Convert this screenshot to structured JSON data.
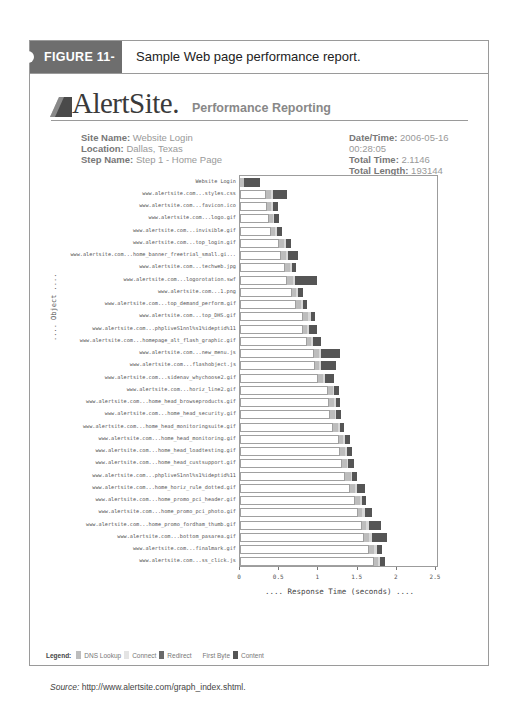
{
  "figure": {
    "tag": "FIGURE 11-5",
    "caption": "Sample Web page performance report."
  },
  "brand": {
    "name": "AlertSite.",
    "subtitle": "Performance Reporting"
  },
  "meta": {
    "site_name_label": "Site Name:",
    "site_name": "Website Login",
    "location_label": "Location:",
    "location": "Dallas, Texas",
    "step_name_label": "Step Name:",
    "step_name": "Step 1 - Home Page",
    "datetime_label": "Date/Time:",
    "datetime": "2006-05-16 00:28:05",
    "total_time_label": "Total Time:",
    "total_time": "2.1146",
    "total_length_label": "Total Length:",
    "total_length": "193144"
  },
  "legend": {
    "title": "Legend:",
    "items": [
      {
        "label": "DNS Lookup",
        "color": "#bdbdbd"
      },
      {
        "label": "Connect",
        "color": "#e4e4e4"
      },
      {
        "label": "Redirect",
        "color": "#6a6a6a"
      },
      {
        "label": "First Byte",
        "color": "#ffffff"
      },
      {
        "label": "Content",
        "color": "#555555"
      }
    ]
  },
  "source": {
    "label": "Source:",
    "text": " http://www.alertsite.com/graph_index.shtml."
  },
  "chart_data": {
    "type": "bar",
    "orientation": "horizontal-waterfall",
    "title": "",
    "xlabel": ".... Response Time (seconds) ....",
    "ylabel": ".... Object ....",
    "xlim": [
      0,
      2.5
    ],
    "xticks": [
      "0",
      "0.5",
      "1",
      "1.5",
      "2",
      "2.5"
    ],
    "grid": false,
    "legend_position": "bottom",
    "categories": [
      "Website Login",
      "www.alertsite.com...styles.css",
      "www.alertsite.com...favicon.ico",
      "www.alertsite.com...logo.gif",
      "www.alertsite.com...invisible.gif",
      "www.alertsite.com...top_login.gif",
      "www.alertsite.com...home_banner_freetrial_small.gi...",
      "www.alertsite.com...techweb.jpg",
      "www.alertsite.com...logorotation.swf",
      "www.alertsite.com...1.png",
      "www.alertsite.com...top_demand_perform.gif",
      "www.alertsite.com...top_DHS.gif",
      "www.alertsite.com...phpliveS1nnl%s1%ideptid%11",
      "www.alertsite.com...homepage_alt_flash_graphic.gif",
      "www.alertsite.com...new_menu.js",
      "www.alertsite.com...flashobject.js",
      "www.alertsite.com...sidenav_whychoose2.gif",
      "www.alertsite.com...horiz_line2.gif",
      "www.alertsite.com...home_head_browseproducts.gif",
      "www.alertsite.com...home_head_security.gif",
      "www.alertsite.com...home_head_monitoringsuite.gif",
      "www.alertsite.com...home_head_monitoring.gif",
      "www.alertsite.com...home_head_loadtesting.gif",
      "www.alertsite.com...home_head_custsupport.gif",
      "www.alertsite.com...phpliveS1nnl%s1%ideptid%11",
      "www.alertsite.com...home_horiz_rule_dotted.gif",
      "www.alertsite.com...home_promo_pci_header.gif",
      "www.alertsite.com...home_promo_pci_photo.gif",
      "www.alertsite.com...home_promo_fordham_thumb.gif",
      "www.alertsite.com...bottom_pasarea.gif",
      "www.alertsite.com...finalmark.gif",
      "www.alertsite.com...ss_click.js"
    ],
    "series": [
      {
        "name": "First Byte (start offset)",
        "values": [
          0.0,
          0.33,
          0.35,
          0.37,
          0.4,
          0.5,
          0.52,
          0.58,
          0.6,
          0.66,
          0.72,
          0.8,
          0.8,
          0.85,
          0.95,
          0.96,
          1.0,
          1.12,
          1.14,
          1.15,
          1.19,
          1.26,
          1.28,
          1.3,
          1.34,
          1.4,
          1.47,
          1.5,
          1.55,
          1.58,
          1.65,
          1.71
        ]
      },
      {
        "name": "DNS Lookup",
        "values": [
          0.05,
          0.06,
          0.05,
          0.05,
          0.05,
          0.06,
          0.07,
          0.06,
          0.08,
          0.06,
          0.06,
          0.07,
          0.06,
          0.06,
          0.06,
          0.05,
          0.06,
          0.06,
          0.06,
          0.06,
          0.06,
          0.06,
          0.06,
          0.06,
          0.07,
          0.07,
          0.06,
          0.06,
          0.06,
          0.06,
          0.06,
          0.05
        ]
      },
      {
        "name": "Connect",
        "values": [
          0.0,
          0.03,
          0.02,
          0.02,
          0.02,
          0.03,
          0.02,
          0.02,
          0.02,
          0.02,
          0.02,
          0.03,
          0.02,
          0.02,
          0.02,
          0.02,
          0.02,
          0.02,
          0.02,
          0.02,
          0.02,
          0.02,
          0.02,
          0.02,
          0.02,
          0.02,
          0.02,
          0.03,
          0.04,
          0.04,
          0.04,
          0.02
        ]
      },
      {
        "name": "Content",
        "values": [
          0.2,
          0.18,
          0.06,
          0.06,
          0.06,
          0.06,
          0.13,
          0.06,
          0.28,
          0.06,
          0.06,
          0.06,
          0.1,
          0.1,
          0.25,
          0.2,
          0.12,
          0.06,
          0.06,
          0.06,
          0.06,
          0.06,
          0.07,
          0.07,
          0.06,
          0.11,
          0.06,
          0.1,
          0.15,
          0.2,
          0.06,
          0.07
        ]
      }
    ]
  }
}
